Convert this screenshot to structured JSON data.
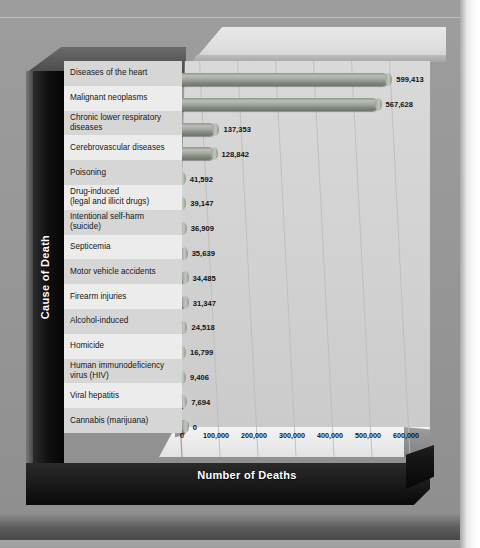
{
  "chart_data": {
    "type": "bar",
    "orientation": "horizontal",
    "title": "",
    "xlabel": "Number of Deaths",
    "ylabel": "Cause of Death",
    "grid": true,
    "legend": "none",
    "xlim": [
      0,
      650000
    ],
    "xticks": [
      "0",
      "100,000",
      "200,000",
      "300,000",
      "400,000",
      "500,000",
      "600,000"
    ],
    "xtick_values": [
      0,
      100000,
      200000,
      300000,
      400000,
      500000,
      600000
    ],
    "categories": [
      "Diseases of the heart",
      "Malignant neoplasms",
      "Chronic lower respiratory diseases",
      "Cerebrovascular diseases",
      "Poisoning",
      "Drug-induced (legal and illicit drugs)",
      "Intentional self-harm (suicide)",
      "Septicemia",
      "Motor vehicle accidents",
      "Firearm injuries",
      "Alcohol-induced",
      "Homicide",
      "Human immunodeficiency virus (HIV)",
      "Viral hepatitis",
      "Cannabis (marijuana)"
    ],
    "values": [
      599413,
      567628,
      137353,
      128842,
      41592,
      39147,
      36909,
      35639,
      34485,
      31347,
      24518,
      16799,
      9406,
      7694,
      0
    ],
    "value_labels": [
      "599,413",
      "567,628",
      "137,353",
      "128,842",
      "41,592",
      "39,147",
      "36,909",
      "35,639",
      "34,485",
      "31,347",
      "24,518",
      "16,799",
      "9,406",
      "7,694",
      "0"
    ],
    "bar_color": "#9aa199",
    "panel_color": "#d4d4d4",
    "frame_color": "#0a0a0a"
  },
  "axis": {
    "y_title": "Cause of Death",
    "x_title": "Number of Deaths"
  },
  "rows": [
    {
      "label_line1": "Diseases of the heart",
      "label_line2": "",
      "value": "599,413"
    },
    {
      "label_line1": "Malignant neoplasms",
      "label_line2": "",
      "value": "567,628"
    },
    {
      "label_line1": "Chronic lower respiratory",
      "label_line2": "diseases",
      "value": "137,353"
    },
    {
      "label_line1": "Cerebrovascular diseases",
      "label_line2": "",
      "value": "128,842"
    },
    {
      "label_line1": "Poisoning",
      "label_line2": "",
      "value": "41,592"
    },
    {
      "label_line1": "Drug-induced",
      "label_line2": "(legal and illicit drugs)",
      "value": "39,147"
    },
    {
      "label_line1": "Intentional self-harm",
      "label_line2": "(suicide)",
      "value": "36,909"
    },
    {
      "label_line1": "Septicemia",
      "label_line2": "",
      "value": "35,639"
    },
    {
      "label_line1": "Motor vehicle accidents",
      "label_line2": "",
      "value": "34,485"
    },
    {
      "label_line1": "Firearm injuries",
      "label_line2": "",
      "value": "31,347"
    },
    {
      "label_line1": "Alcohol-induced",
      "label_line2": "",
      "value": "24,518"
    },
    {
      "label_line1": "Homicide",
      "label_line2": "",
      "value": "16,799"
    },
    {
      "label_line1": "Human immunodeficiency",
      "label_line2": "virus (HIV)",
      "value": "9,406"
    },
    {
      "label_line1": "Viral hepatitis",
      "label_line2": "",
      "value": "7,694"
    },
    {
      "label_line1": "Cannabis (marijuana)",
      "label_line2": "",
      "value": "0"
    }
  ]
}
